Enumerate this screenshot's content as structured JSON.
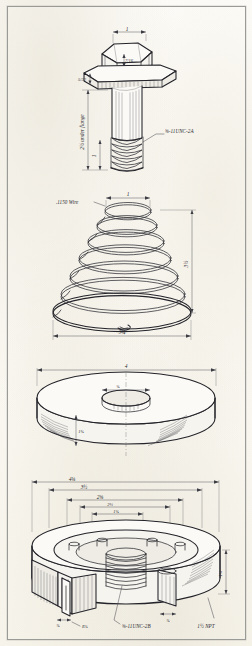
{
  "sheet": {
    "title": "Engineering Drawing Sheet",
    "medium": "hand-inked isometric pictorial drawings",
    "paper_color": "#fcfbf7",
    "ink_color": "#2b2b31",
    "border_color": "#9a9a96"
  },
  "panels": [
    {
      "id": "hex-bolt",
      "name": "Hex head flange bolt",
      "annotations": {
        "head_width": "1",
        "head_height": "7/16",
        "flange_thickness": "5/32",
        "under_flange_label": "2½ under flange",
        "thread_length": "1",
        "thread_spec": "⅝-11UNC-2A"
      }
    },
    {
      "id": "conical-spring",
      "name": "Conical compression spring",
      "annotations": {
        "wire_label": ".1150 Wire",
        "top_diameter": "1",
        "free_height": "3½",
        "bottom_diameter": "3¼"
      }
    },
    {
      "id": "disk",
      "name": "Bored disk / spacer",
      "annotations": {
        "outside_diameter": "4",
        "bore_diameter": "⅝",
        "thickness": "1⅛"
      }
    },
    {
      "id": "threaded-hub",
      "name": "Sectioned threaded hub with tapped bosses",
      "annotations": {
        "dim_1": "4⅛",
        "dim_2": "3½",
        "dim_3": "2⅝",
        "dim_4": "2¼",
        "dim_5": "1⅝",
        "height": "1¾",
        "slot_width": "⅜",
        "boss_width": "⅜",
        "radius_note": "R⅜",
        "internal_thread": "⅝-11UNC-2B",
        "pipe_thread": "1½ NPT"
      }
    }
  ]
}
